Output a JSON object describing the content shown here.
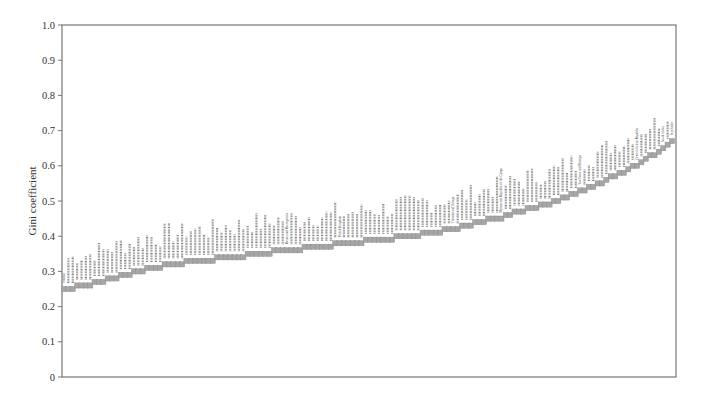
{
  "chart_data": {
    "type": "scatter",
    "title": "",
    "xlabel": "",
    "ylabel": "Gini coefficient",
    "ylim": [
      0,
      1.0
    ],
    "yticks": [
      "0",
      "0.1",
      "0.2",
      "0.3",
      "0.4",
      "0.5",
      "0.6",
      "0.7",
      "0.8",
      "0.9",
      "1.0"
    ],
    "grid": false,
    "legend": null,
    "marker": "square",
    "marker_color": "#a6a6a6",
    "sorted": "ascending",
    "n_points_approx": 140,
    "curve_anchors": [
      {
        "rank_frac": 0.0,
        "value": 0.25
      },
      {
        "rank_frac": 0.06,
        "value": 0.27
      },
      {
        "rank_frac": 0.14,
        "value": 0.31
      },
      {
        "rank_frac": 0.22,
        "value": 0.33
      },
      {
        "rank_frac": 0.32,
        "value": 0.35
      },
      {
        "rank_frac": 0.42,
        "value": 0.37
      },
      {
        "rank_frac": 0.52,
        "value": 0.39
      },
      {
        "rank_frac": 0.61,
        "value": 0.41
      },
      {
        "rank_frac": 0.71,
        "value": 0.45
      },
      {
        "rank_frac": 0.81,
        "value": 0.5
      },
      {
        "rank_frac": 0.87,
        "value": 0.54
      },
      {
        "rank_frac": 0.94,
        "value": 0.6
      },
      {
        "rank_frac": 1.0,
        "value": 0.665
      }
    ],
    "highlighted_labels": [
      {
        "label": "Sweden",
        "rank_frac": 0.0
      },
      {
        "label": "Bosnia and Herzegovina",
        "rank_frac": 0.37
      },
      {
        "label": "United Kingdom",
        "rank_frac": 0.45
      },
      {
        "label": "Trinidad and Tobago",
        "rank_frac": 0.64
      },
      {
        "label": "Democratic Republic of the Congo",
        "rank_frac": 0.72
      },
      {
        "label": "Sao Tome and Principe",
        "rank_frac": 0.85
      },
      {
        "label": "Central African Republic",
        "rank_frac": 0.94
      },
      {
        "label": "South Africa",
        "rank_frac": 0.985
      },
      {
        "label": "Seychelles",
        "rank_frac": 1.0
      }
    ],
    "note": "Each marker is annotated with a tiny rotated country name; most names are illegible at this resolution."
  }
}
